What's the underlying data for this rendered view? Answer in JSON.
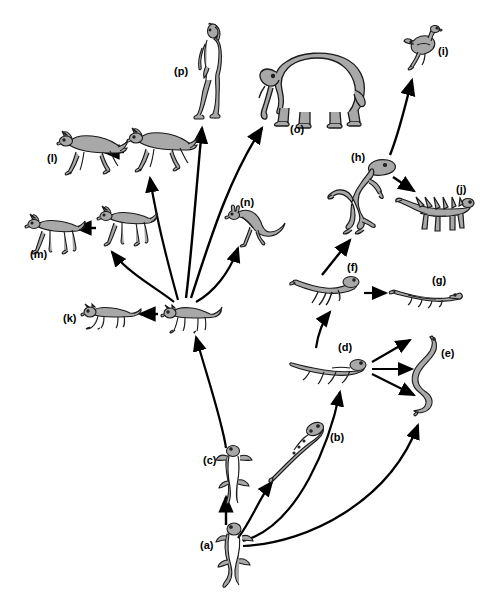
{
  "figure": {
    "type": "phylogenetic-evolution-diagram",
    "title": "",
    "background_color": "#ffffff",
    "line_color": "#000000",
    "organism_fill": "#a8a8a8",
    "organism_stroke": "#1a1a1a",
    "width": 495,
    "height": 603
  },
  "nodes": [
    {
      "id": "a",
      "label": "(a)",
      "organism": "salamander-ancestral-amphibian",
      "label_x": 200,
      "label_y": 540,
      "art_x": 215,
      "art_y": 520,
      "art_w": 40,
      "art_h": 70
    },
    {
      "id": "b",
      "label": "(b)",
      "organism": "aquatic-amphibian-newt",
      "label_x": 330,
      "label_y": 432,
      "art_x": 268,
      "art_y": 418,
      "art_w": 58,
      "art_h": 66
    },
    {
      "id": "c",
      "label": "(c)",
      "organism": "terrestrial-salamander",
      "label_x": 203,
      "label_y": 455,
      "art_x": 216,
      "art_y": 443,
      "art_w": 36,
      "art_h": 62
    },
    {
      "id": "d",
      "label": "(d)",
      "organism": "early-reptile-lizard",
      "label_x": 338,
      "label_y": 342,
      "art_x": 288,
      "art_y": 352,
      "art_w": 78,
      "art_h": 34
    },
    {
      "id": "e",
      "label": "(e)",
      "organism": "snake",
      "label_x": 441,
      "label_y": 348,
      "art_x": 404,
      "art_y": 334,
      "art_w": 38,
      "art_h": 82
    },
    {
      "id": "f",
      "label": "(f)",
      "organism": "bipedal-reptile",
      "label_x": 347,
      "label_y": 262,
      "art_x": 288,
      "art_y": 272,
      "art_w": 72,
      "art_h": 34
    },
    {
      "id": "g",
      "label": "(g)",
      "organism": "crocodile",
      "label_x": 432,
      "label_y": 275,
      "art_x": 388,
      "art_y": 286,
      "art_w": 76,
      "art_h": 22
    },
    {
      "id": "h",
      "label": "(h)",
      "organism": "theropod-dinosaur",
      "label_x": 351,
      "label_y": 152,
      "art_x": 327,
      "art_y": 155,
      "art_w": 78,
      "art_h": 80
    },
    {
      "id": "i",
      "label": "(i)",
      "organism": "bird",
      "label_x": 438,
      "label_y": 46,
      "art_x": 403,
      "art_y": 25,
      "art_w": 40,
      "art_h": 46
    },
    {
      "id": "j",
      "label": "(j)",
      "organism": "stegosaurus",
      "label_x": 456,
      "label_y": 184,
      "art_x": 394,
      "art_y": 185,
      "art_w": 80,
      "art_h": 50
    },
    {
      "id": "k",
      "label": "(k)",
      "organism": "carnivore-mammal-cat",
      "label_x": 63,
      "label_y": 313,
      "art_x": 80,
      "art_y": 303,
      "art_w": 62,
      "art_h": 26
    },
    {
      "id": "l",
      "label": "(l)",
      "organism": "modern-horse-galloping",
      "label_x": 47,
      "label_y": 153,
      "art_x": 56,
      "art_y": 131,
      "art_w": 72,
      "art_h": 44
    },
    {
      "id": "m",
      "label": "(m)",
      "organism": "early-horse-trotting",
      "label_x": 30,
      "label_y": 249,
      "art_x": 24,
      "art_y": 213,
      "art_w": 62,
      "art_h": 42
    },
    {
      "id": "n",
      "label": "(n)",
      "organism": "kangaroo-marsupial",
      "label_x": 240,
      "label_y": 197,
      "art_x": 224,
      "art_y": 203,
      "art_w": 62,
      "art_h": 44
    },
    {
      "id": "o",
      "label": "(o)",
      "organism": "elephant",
      "label_x": 290,
      "label_y": 124,
      "art_x": 256,
      "art_y": 46,
      "art_w": 112,
      "art_h": 82
    },
    {
      "id": "p",
      "label": "(p)",
      "organism": "human",
      "label_x": 174,
      "label_y": 66,
      "art_x": 193,
      "art_y": 22,
      "art_w": 30,
      "art_h": 98
    },
    {
      "id": "hub-mammal",
      "label": "",
      "organism": "ancestral-mammal",
      "label_x": 0,
      "label_y": 0,
      "art_x": 160,
      "art_y": 303,
      "art_w": 62,
      "art_h": 30
    },
    {
      "id": "horse-2",
      "label": "",
      "organism": "horse-intermediate-galloping",
      "label_x": 0,
      "label_y": 0,
      "art_x": 126,
      "art_y": 128,
      "art_w": 72,
      "art_h": 44
    },
    {
      "id": "horse-4",
      "label": "",
      "organism": "horse-intermediate-trotting",
      "label_x": 0,
      "label_y": 0,
      "art_x": 96,
      "art_y": 205,
      "art_w": 62,
      "art_h": 42
    }
  ],
  "connections": [
    {
      "from": "a",
      "to": "c",
      "style": "straight-arrow",
      "description": "ancestral amphibian to terrestrial salamander"
    },
    {
      "from": "a",
      "to": "b",
      "style": "curved-arrow",
      "description": "ancestral amphibian to aquatic amphibian"
    },
    {
      "from": "a",
      "to": "e",
      "style": "long-curved-arrow",
      "description": "ancestral amphibian to snake lineage"
    },
    {
      "from": "a",
      "to": "d",
      "style": "curved-arrow",
      "description": "ancestral amphibian to early reptile"
    },
    {
      "from": "c",
      "to": "hub-mammal",
      "style": "straight-arrow",
      "description": "amphibian to ancestral mammal"
    },
    {
      "from": "d",
      "to": "e",
      "style": "triple-arrow",
      "description": "early reptile to snake"
    },
    {
      "from": "d",
      "to": "f",
      "style": "curved-arrow",
      "description": "early reptile to bipedal reptile"
    },
    {
      "from": "f",
      "to": "g",
      "style": "straight-arrow",
      "description": "bipedal reptile to crocodile"
    },
    {
      "from": "f",
      "to": "h",
      "style": "straight-arrow",
      "description": "bipedal reptile to theropod dinosaur"
    },
    {
      "from": "h",
      "to": "i",
      "style": "curved-arrow",
      "description": "theropod dinosaur to bird"
    },
    {
      "from": "h",
      "to": "j",
      "style": "straight-arrow",
      "description": "theropod to stegosaurus"
    },
    {
      "from": "hub-mammal",
      "to": "k",
      "style": "straight-arrow",
      "description": "ancestral mammal to carnivore"
    },
    {
      "from": "hub-mammal",
      "to": "horse-2",
      "style": "fan-curve",
      "description": "ancestral mammal to horse lineage (upper)"
    },
    {
      "from": "hub-mammal",
      "to": "horse-4",
      "style": "fan-curve",
      "description": "ancestral mammal to horse lineage (lower)"
    },
    {
      "from": "hub-mammal",
      "to": "p",
      "style": "fan-curve",
      "description": "ancestral mammal to human"
    },
    {
      "from": "hub-mammal",
      "to": "o",
      "style": "fan-curve",
      "description": "ancestral mammal to elephant"
    },
    {
      "from": "hub-mammal",
      "to": "n",
      "style": "fan-curve",
      "description": "ancestral mammal to kangaroo"
    },
    {
      "from": "horse-2",
      "to": "l",
      "style": "straight-arrow",
      "description": "intermediate horse to modern horse"
    },
    {
      "from": "horse-4",
      "to": "m",
      "style": "straight-arrow",
      "description": "intermediate horse to early horse"
    }
  ]
}
